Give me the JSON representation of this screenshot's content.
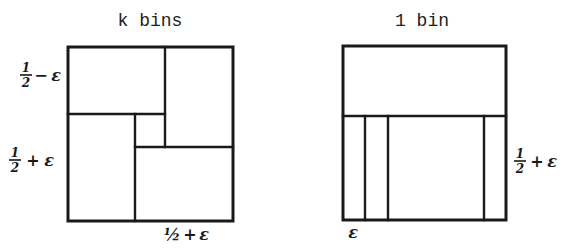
{
  "diagram": {
    "colors": {
      "ink": "#1a1a1a",
      "background": "#ffffff"
    },
    "left_panel": {
      "title": "k bins",
      "labels": {
        "top_left": {
          "num": "1",
          "den": "2",
          "op": "−",
          "var": "ε"
        },
        "mid_left": {
          "num": "1",
          "den": "2",
          "op": "+",
          "var": "ε"
        },
        "bottom": {
          "frac": "½",
          "op": "+",
          "var": "ε"
        }
      },
      "description": "Square bin packed with four rectangles arranged in a pinwheel around a small central square"
    },
    "right_panel": {
      "title": "1 bin",
      "labels": {
        "right": {
          "num": "1",
          "den": "2",
          "op": "+",
          "var": "ε"
        },
        "bottom_left": {
          "var": "ε"
        }
      },
      "description": "Square bin with a wide top rectangle and several thin vertical strips of width ε below"
    }
  }
}
